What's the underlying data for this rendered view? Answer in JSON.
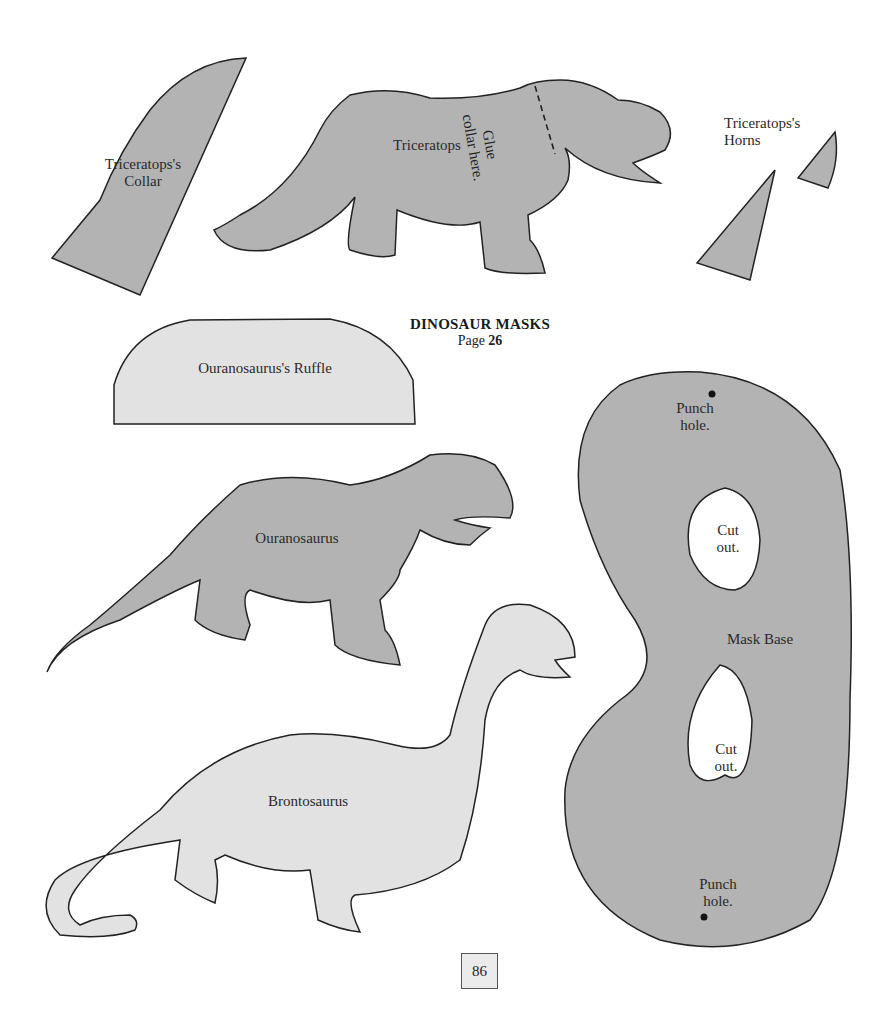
{
  "title": {
    "heading": "DINOSAUR MASKS",
    "page_prefix": "Page",
    "page_ref": "26"
  },
  "page_number": "86",
  "colors": {
    "dark_gray": "#b3b3b3",
    "light_gray": "#e2e2e2",
    "outline": "#222222",
    "background": "#ffffff"
  },
  "pieces": {
    "triceratops_collar": {
      "line1": "Triceratops's",
      "line2": "Collar"
    },
    "triceratops": {
      "label": "Triceratops",
      "glue_line1": "Glue",
      "glue_line2": "collar here."
    },
    "triceratops_horns": {
      "line1": "Triceratops's",
      "line2": "Horns"
    },
    "ouranosaurus_ruffle": {
      "label": "Ouranosaurus's Ruffle"
    },
    "ouranosaurus": {
      "label": "Ouranosaurus"
    },
    "brontosaurus": {
      "label": "Brontosaurus"
    },
    "mask_base": {
      "label": "Mask Base",
      "punch_top_1": "Punch",
      "punch_top_2": "hole.",
      "cut_top_1": "Cut",
      "cut_top_2": "out.",
      "cut_bottom_1": "Cut",
      "cut_bottom_2": "out.",
      "punch_bottom_1": "Punch",
      "punch_bottom_2": "hole."
    }
  }
}
